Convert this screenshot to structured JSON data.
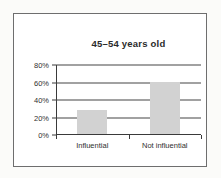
{
  "chart_data": {
    "type": "bar",
    "title": "45–54 years old",
    "categories": [
      "Influential",
      "Not influential"
    ],
    "values": [
      28,
      60
    ],
    "xlabel": "",
    "ylabel": "",
    "ylim": [
      0,
      80
    ],
    "yticks": [
      "0%",
      "20%",
      "40%",
      "60%",
      "80%"
    ],
    "ytick_values": [
      0,
      20,
      40,
      60,
      80
    ],
    "grid": true,
    "legend": "none",
    "bar_color": "#d2d2d2",
    "axis_color": "#3a3a3a",
    "background_color": "#ffffff"
  }
}
